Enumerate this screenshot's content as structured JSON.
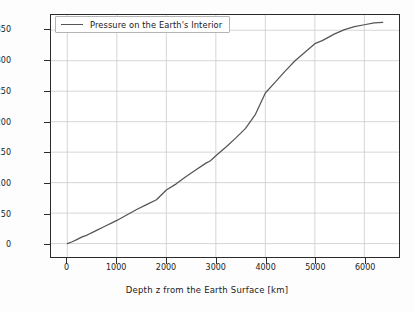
{
  "chart_data": {
    "type": "line",
    "title": "",
    "xlabel": "Depth z from the Earth Surface [km]",
    "ylabel": "P [GPa]",
    "xlim": [
      -330,
      6700
    ],
    "ylim": [
      -22,
      375
    ],
    "grid": true,
    "legend_position": "upper left",
    "legend_entries": [
      "Pressure on the Earth's Interior"
    ],
    "xticks": [
      0,
      1000,
      2000,
      3000,
      4000,
      5000,
      6000
    ],
    "xtick_labels": [
      "0",
      "1000",
      "2000",
      "3000",
      "4000",
      "5000",
      "6000"
    ],
    "yticks": [
      0,
      50,
      100,
      150,
      200,
      250,
      300,
      350
    ],
    "ytick_labels": [
      "0",
      "50",
      "100",
      "150",
      "200",
      "250",
      "300",
      "350"
    ],
    "line_color": "#555555",
    "grid_color": "#cccccc",
    "axes_color": "#2b2b2b",
    "series": [
      {
        "name": "Pressure on the Earth's Interior",
        "x": [
          0,
          100,
          200,
          300,
          400,
          500,
          600,
          700,
          800,
          900,
          1000,
          1200,
          1400,
          1600,
          1800,
          2000,
          2200,
          2400,
          2600,
          2800,
          2891,
          3000,
          3200,
          3400,
          3600,
          3800,
          4000,
          4200,
          4400,
          4600,
          4800,
          5000,
          5150,
          5400,
          5600,
          5800,
          6000,
          6200,
          6371
        ],
        "y": [
          0,
          3,
          7,
          11,
          14,
          18,
          22,
          26,
          30,
          34,
          38,
          47,
          56,
          64,
          72,
          88,
          98,
          110,
          121,
          132,
          136,
          144,
          158,
          173,
          189,
          212,
          247,
          265,
          283,
          300,
          314,
          328,
          333,
          344,
          351,
          356,
          359,
          362,
          363
        ]
      }
    ],
    "annotations": []
  }
}
